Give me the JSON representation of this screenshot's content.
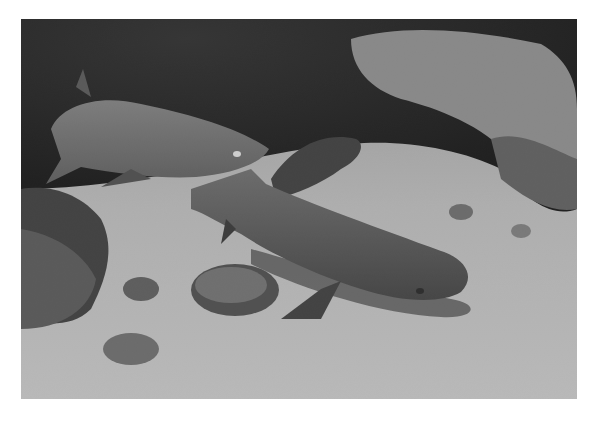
{
  "image": {
    "description": "Grayscale underwater photograph of white-tip reef sharks resting on a sandy seabed beside rocks",
    "subjects": [
      "shark resting on sand (foreground)",
      "shark swimming (upper left)",
      "partially hidden shark (background)"
    ],
    "palette": {
      "background": "#ffffff",
      "sand": "#b9b9b9",
      "rock_dark": "#1c1c1c",
      "shark": "#5a5a5a"
    }
  }
}
